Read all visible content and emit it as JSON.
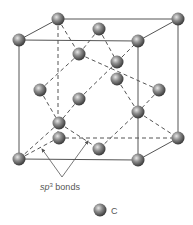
{
  "diagram": {
    "annotation": {
      "label_prefix": "sp",
      "label_superscript": "3",
      "label_suffix": " bonds"
    },
    "legend": {
      "items": [
        {
          "symbol": "atom",
          "label": "C",
          "color": "#808080"
        }
      ]
    },
    "atom_color": "#7a7a7a",
    "line_color": "#555555"
  }
}
